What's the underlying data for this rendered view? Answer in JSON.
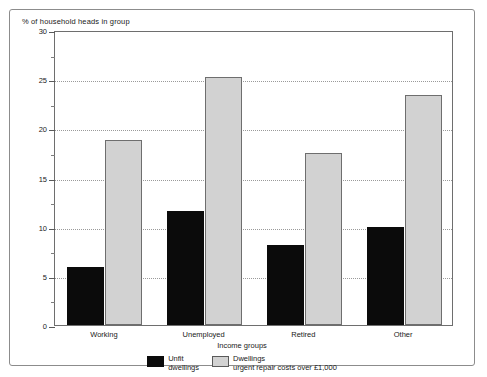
{
  "chart_data": {
    "type": "bar",
    "title": "",
    "ylabel": "% of household heads in group",
    "xlabel": "Income groups",
    "categories": [
      "Working",
      "Unemployed",
      "Retired",
      "Other"
    ],
    "series": [
      {
        "name": "Unfit dwellings",
        "legend_line1": "Unfit",
        "legend_line2": "dwellings",
        "color": "#0b0b0b",
        "values": [
          5.9,
          11.6,
          8.1,
          10.0
        ]
      },
      {
        "name": "Dwellings urgent repair costs over £1,000",
        "legend_line1": "Dwellings",
        "legend_line2": "urgent repair costs over £1,000",
        "color": "#d2d2d2",
        "values": [
          18.8,
          25.2,
          17.5,
          23.4
        ]
      }
    ],
    "ylim": [
      0,
      30
    ],
    "yticks": [
      0,
      5,
      10,
      15,
      20,
      25,
      30
    ],
    "ytick_labels": [
      "0",
      "5",
      "10",
      "15",
      "20",
      "25",
      "30"
    ],
    "yminor_ticks": [
      2.5,
      7.5,
      12.5,
      17.5,
      22.5,
      27.5
    ],
    "grid": true,
    "grid_axis": "y",
    "legend_position": "bottom-center"
  }
}
